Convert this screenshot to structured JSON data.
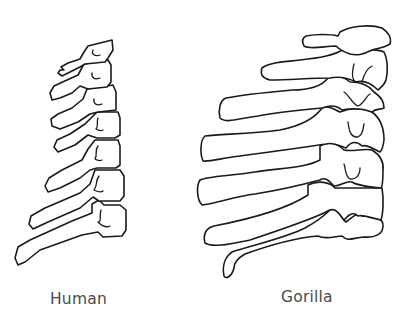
{
  "figure": {
    "stroke_color": "#1a1a1a",
    "background": "#ffffff",
    "panels": [
      {
        "id": "human",
        "label": "Human",
        "vertebrae_count": 7
      },
      {
        "id": "gorilla",
        "label": "Gorilla",
        "vertebrae_count": 7
      }
    ]
  },
  "labels": {
    "human": "Human",
    "gorilla": "Gorilla"
  }
}
